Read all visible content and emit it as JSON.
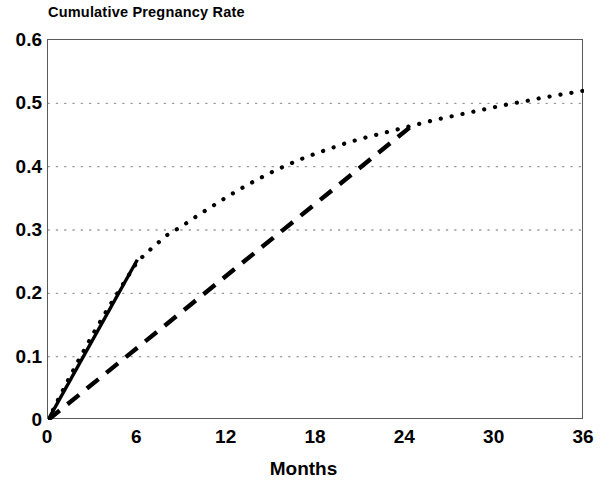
{
  "chart_data": {
    "type": "line",
    "title": "Cumulative Pregnancy Rate",
    "xlabel": "Months",
    "ylabel": "",
    "xlim": [
      0,
      36
    ],
    "ylim": [
      0,
      0.6
    ],
    "grid": true,
    "grid_axis": "y",
    "grid_style": "dotted",
    "legend": null,
    "legend_position": "none",
    "xticks": [
      "0",
      "6",
      "12",
      "18",
      "24",
      "30",
      "36"
    ],
    "xtick_values": [
      0,
      6,
      12,
      18,
      24,
      30,
      36
    ],
    "yticks": [
      "0",
      "0.1",
      "0.2",
      "0.3",
      "0.4",
      "0.5",
      "0.6"
    ],
    "ytick_values": [
      0,
      0.1,
      0.2,
      0.3,
      0.4,
      0.5,
      0.6
    ],
    "series": [
      {
        "name": "dotted-curve",
        "style": "dotted",
        "color": "#000000",
        "x": [
          0,
          1,
          2,
          3,
          4,
          5,
          6,
          7,
          8,
          9,
          10,
          11,
          12,
          13,
          14,
          15,
          16,
          17,
          18,
          19,
          20,
          21,
          22,
          23,
          24,
          25,
          26,
          27,
          28,
          29,
          30,
          31,
          32,
          33,
          34,
          35,
          36
        ],
        "y": [
          0.0,
          0.047,
          0.092,
          0.135,
          0.175,
          0.213,
          0.25,
          0.272,
          0.292,
          0.306,
          0.322,
          0.337,
          0.352,
          0.366,
          0.379,
          0.391,
          0.402,
          0.412,
          0.421,
          0.429,
          0.437,
          0.444,
          0.45,
          0.456,
          0.462,
          0.468,
          0.474,
          0.479,
          0.484,
          0.489,
          0.494,
          0.499,
          0.503,
          0.508,
          0.512,
          0.516,
          0.52
        ]
      },
      {
        "name": "solid-line",
        "style": "solid",
        "color": "#000000",
        "x": [
          0,
          6
        ],
        "y": [
          0.0,
          0.253
        ]
      },
      {
        "name": "dashed-line",
        "style": "dashed",
        "color": "#000000",
        "x": [
          0,
          24.3
        ],
        "y": [
          0.0,
          0.462
        ]
      }
    ]
  },
  "axes": {
    "frame_color": "#5a5a5a",
    "gridline_color": "#9a9a9a"
  }
}
